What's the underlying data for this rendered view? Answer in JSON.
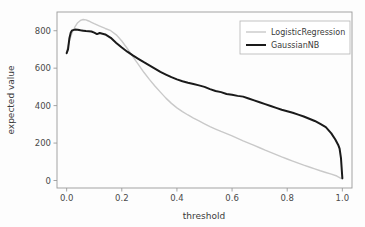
{
  "chart_data": {
    "type": "line",
    "title": "",
    "xlabel": "threshold",
    "ylabel": "expected value",
    "xlim": [
      -0.035,
      1.035
    ],
    "ylim": [
      -40,
      900
    ],
    "xticks": [
      "0.0",
      "0.2",
      "0.4",
      "0.6",
      "0.8",
      "1.0"
    ],
    "xtick_values": [
      0.0,
      0.2,
      0.4,
      0.6,
      0.8,
      1.0
    ],
    "yticks": [
      "0",
      "200",
      "400",
      "600",
      "800"
    ],
    "ytick_values": [
      0,
      200,
      400,
      600,
      800
    ],
    "grid": false,
    "legend_position": "upper right",
    "series": [
      {
        "name": "LogisticRegression",
        "color": "#c9c9c9",
        "linewidth": 1.4,
        "x": [
          0.0,
          0.01,
          0.02,
          0.03,
          0.04,
          0.05,
          0.06,
          0.07,
          0.08,
          0.09,
          0.1,
          0.12,
          0.14,
          0.16,
          0.18,
          0.2,
          0.22,
          0.24,
          0.26,
          0.28,
          0.3,
          0.32,
          0.34,
          0.36,
          0.38,
          0.4,
          0.42,
          0.44,
          0.46,
          0.48,
          0.5,
          0.52,
          0.54,
          0.56,
          0.58,
          0.6,
          0.62,
          0.64,
          0.66,
          0.68,
          0.7,
          0.72,
          0.74,
          0.76,
          0.78,
          0.8,
          0.82,
          0.84,
          0.86,
          0.88,
          0.9,
          0.92,
          0.94,
          0.96,
          0.98,
          0.99,
          1.0
        ],
        "y": [
          690,
          745,
          790,
          820,
          843,
          855,
          860,
          858,
          852,
          845,
          838,
          825,
          812,
          800,
          778,
          745,
          705,
          662,
          620,
          578,
          540,
          505,
          472,
          440,
          412,
          388,
          368,
          350,
          333,
          318,
          303,
          288,
          275,
          262,
          250,
          238,
          225,
          212,
          200,
          188,
          175,
          162,
          150,
          138,
          126,
          115,
          104,
          93,
          82,
          72,
          62,
          52,
          43,
          34,
          24,
          16,
          8
        ]
      },
      {
        "name": "GaussianNB",
        "color": "#1a1a1a",
        "linewidth": 2.0,
        "x": [
          0.0,
          0.005,
          0.01,
          0.015,
          0.02,
          0.03,
          0.04,
          0.05,
          0.06,
          0.07,
          0.08,
          0.09,
          0.1,
          0.11,
          0.12,
          0.14,
          0.16,
          0.18,
          0.2,
          0.22,
          0.24,
          0.26,
          0.28,
          0.3,
          0.32,
          0.34,
          0.36,
          0.38,
          0.4,
          0.42,
          0.44,
          0.46,
          0.48,
          0.5,
          0.52,
          0.54,
          0.56,
          0.58,
          0.6,
          0.62,
          0.64,
          0.66,
          0.68,
          0.7,
          0.72,
          0.74,
          0.76,
          0.78,
          0.8,
          0.82,
          0.84,
          0.86,
          0.88,
          0.9,
          0.92,
          0.94,
          0.96,
          0.975,
          0.985,
          0.99,
          0.995,
          1.0
        ],
        "y": [
          680,
          700,
          760,
          790,
          802,
          806,
          805,
          802,
          800,
          798,
          797,
          796,
          790,
          782,
          788,
          780,
          762,
          735,
          710,
          688,
          668,
          650,
          632,
          615,
          598,
          580,
          566,
          552,
          540,
          530,
          522,
          515,
          508,
          500,
          488,
          478,
          472,
          462,
          458,
          452,
          448,
          438,
          428,
          418,
          408,
          398,
          388,
          378,
          370,
          362,
          352,
          342,
          330,
          318,
          302,
          285,
          252,
          218,
          190,
          170,
          120,
          12
        ]
      }
    ]
  }
}
